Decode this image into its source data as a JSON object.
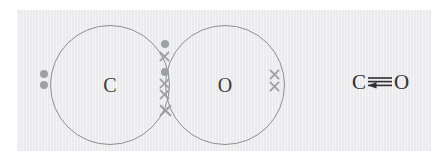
{
  "diagram": {
    "type": "dot-and-cross",
    "molecule": "CO",
    "panel_color": "#ececee",
    "outline_color": "#8e8e96",
    "electron_color": "#9f9fa6",
    "label_color": "#3b3b40"
  },
  "atoms": [
    {
      "id": "carbon",
      "symbol": "C",
      "electron_marker": "dot",
      "cx": 110,
      "cy": 85,
      "r": 60
    },
    {
      "id": "oxygen",
      "symbol": "O",
      "electron_marker": "cross",
      "cx": 225,
      "cy": 85,
      "r": 60
    }
  ],
  "electrons": {
    "carbon_lone_pair": {
      "marker": "dot",
      "count": 2,
      "positions": [
        {
          "x": 44,
          "y": 74
        },
        {
          "x": 44,
          "y": 85
        }
      ]
    },
    "oxygen_lone_pair": {
      "marker": "cross",
      "count": 2,
      "positions": [
        {
          "x": 274,
          "y": 74
        },
        {
          "x": 274,
          "y": 86
        }
      ]
    },
    "shared_overlap": {
      "description": "three shared electron pairs in the overlap region",
      "markers": [
        {
          "marker": "dot",
          "x": 165,
          "y": 44
        },
        {
          "marker": "cross",
          "x": 165,
          "y": 57
        },
        {
          "marker": "dot",
          "x": 165,
          "y": 72
        },
        {
          "marker": "cross",
          "x": 165,
          "y": 84
        },
        {
          "marker": "cross",
          "x": 165,
          "y": 95
        },
        {
          "marker": "cross",
          "x": 165,
          "y": 110
        }
      ]
    }
  },
  "formula": {
    "left_atom": "C",
    "right_atom": "O",
    "bond_type": "triple",
    "bond_lines": 3,
    "dative_arrow": true,
    "arrow_direction": "left",
    "text": "C≡O"
  }
}
